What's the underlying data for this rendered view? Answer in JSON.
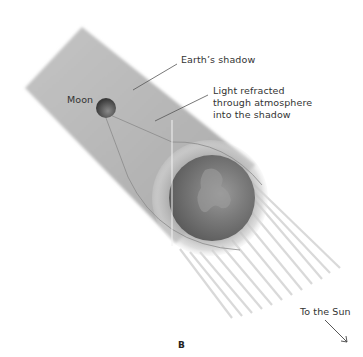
{
  "labels": {
    "earth_shadow": "Earth’s shadow",
    "moon": "Moon",
    "refracted_line1": "Light refracted",
    "refracted_line2": "through atmosphere",
    "refracted_line3": "into the shadow",
    "to_sun": "To the Sun",
    "panel": "B"
  },
  "colors": {
    "shadow": "#b5b5b5",
    "moon": "#4a4a4a",
    "earth": "#6e6e6e",
    "atmosphere": "#c8c8c8",
    "rays": "#d8d8d8",
    "leader": "#555555"
  }
}
